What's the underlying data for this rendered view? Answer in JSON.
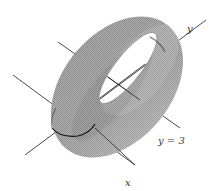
{
  "figure": {
    "labels": {
      "y_axis": "y",
      "x_axis": "x",
      "line": "y = 3"
    },
    "colors": {
      "surface": "#9a9a9a",
      "surface_dark": "#555555",
      "surface_light": "#c8c8c8",
      "axis": "#333333",
      "background": "#ffffff"
    }
  }
}
